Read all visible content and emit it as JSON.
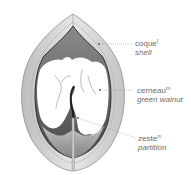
{
  "diagram": {
    "labels": [
      {
        "id": "shell",
        "french": "coque",
        "gender": "f",
        "english": "shell"
      },
      {
        "id": "green-walnut",
        "french": "cerneau",
        "gender": "m",
        "english": "green walnut"
      },
      {
        "id": "partition",
        "french": "zeste",
        "gender": "m",
        "english": "partition"
      }
    ]
  },
  "colors": {
    "shell_outer": "#d9d9d9",
    "shell_edge": "#9a9a9a",
    "cavity_dark": "#555555",
    "kernel": "#ffffff",
    "label_text": "#6d6d6d",
    "leader": "#8a8a8a"
  }
}
